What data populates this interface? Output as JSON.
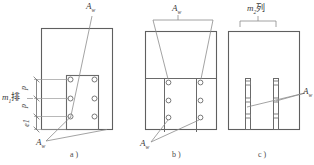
{
  "figure": {
    "title_present": false,
    "stroke_color": "#5a5a5a",
    "thin_stroke_color": "#8a8a8a",
    "text_color": "#3a3a3a",
    "background": "#ffffff",
    "panels": [
      {
        "id": "a",
        "caption": "a )",
        "top_label": {
          "base": "A",
          "sub": "w"
        },
        "bottom_label": {
          "base": "A",
          "sub": "w"
        },
        "left_group_label": {
          "base": "m",
          "sub": "1",
          "cn": "排"
        },
        "dimensions": [
          {
            "label": "p"
          },
          {
            "label": "p"
          },
          {
            "label": "e",
            "sub": "1"
          }
        ],
        "bolt_columns": 2,
        "bolt_rows": 3,
        "bolt_shape": "circle"
      },
      {
        "id": "b",
        "caption": "b )",
        "top_label": {
          "base": "A",
          "sub": "w"
        },
        "bottom_label": {
          "base": "A",
          "sub": "w"
        },
        "bolt_columns": 2,
        "bolt_rows": 3,
        "bolt_shape": "circle"
      },
      {
        "id": "c",
        "caption": "c )",
        "top_label": {
          "base": "m",
          "sub": "2",
          "cn": "列"
        },
        "right_label": {
          "base": "A",
          "sub": "w"
        },
        "bolt_columns": 2,
        "bolt_rows": 3,
        "bolt_shape": "rect"
      }
    ]
  }
}
